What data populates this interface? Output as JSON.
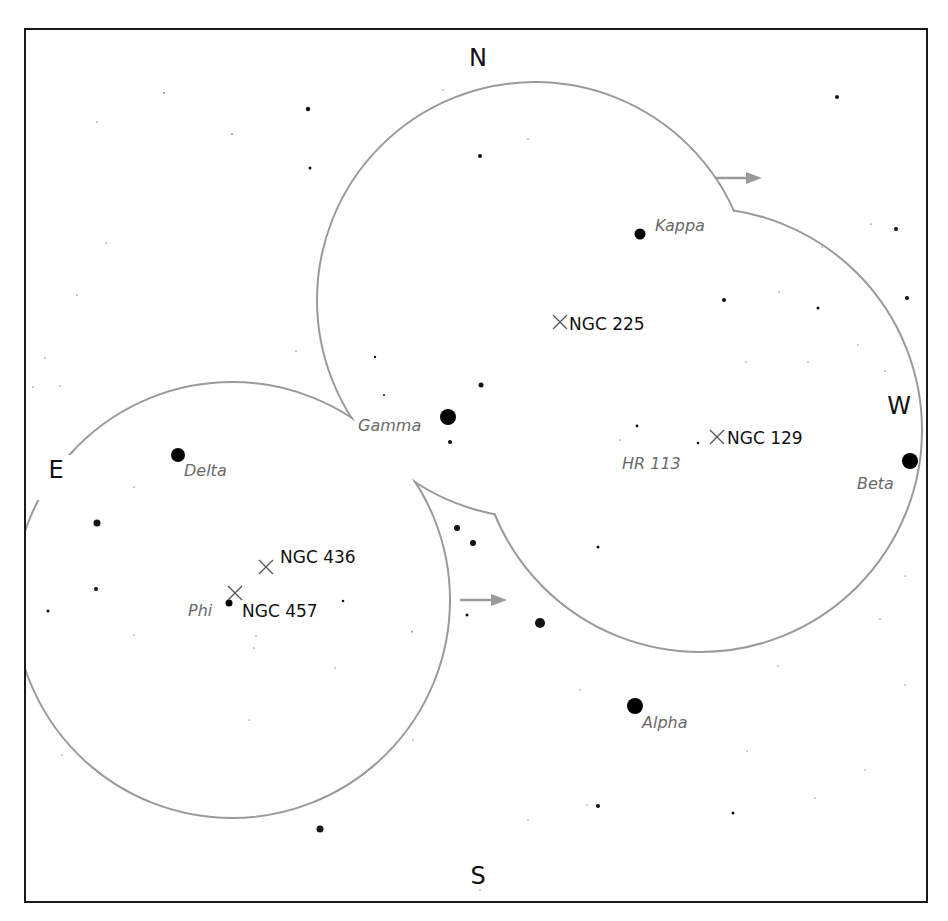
{
  "map": {
    "type": "sky-finder-chart",
    "compass": {
      "north": "N",
      "south": "S",
      "east": "E",
      "west": "W"
    },
    "colors": {
      "outline": "#9a9a9a",
      "star": "#000000",
      "star_label": "#6a6a6a",
      "object_label": "#111111",
      "frame": "#1a1a1a"
    },
    "named_stars": [
      {
        "name": "Kappa",
        "x": 640,
        "y": 234,
        "r": 5.5
      },
      {
        "name": "Gamma",
        "x": 448,
        "y": 417,
        "r": 8
      },
      {
        "name": "Delta",
        "x": 178,
        "y": 455,
        "r": 7
      },
      {
        "name": "Beta",
        "x": 910,
        "y": 461,
        "r": 8
      },
      {
        "name": "Alpha",
        "x": 635,
        "y": 706,
        "r": 8
      },
      {
        "name": "Phi",
        "x": 229,
        "y": 603,
        "r": 3.5
      },
      {
        "name": "HR 113",
        "x": 698,
        "y": 443,
        "r": 1.2
      }
    ],
    "deep_sky_objects": [
      {
        "name": "NGC 225",
        "x": 560,
        "y": 322
      },
      {
        "name": "NGC 129",
        "x": 717,
        "y": 437
      },
      {
        "name": "NGC 436",
        "x": 266,
        "y": 567
      },
      {
        "name": "NGC 457",
        "x": 235,
        "y": 593
      }
    ],
    "motion_arrows": [
      {
        "x1": 716,
        "y1": 178,
        "x2": 762,
        "y2": 178
      },
      {
        "x1": 460,
        "y1": 600,
        "x2": 507,
        "y2": 600
      }
    ],
    "field_circles": [
      {
        "cx": 535,
        "cy": 300,
        "r": 218
      },
      {
        "cx": 700,
        "cy": 430,
        "r": 222
      },
      {
        "cx": 232,
        "cy": 600,
        "r": 218
      }
    ]
  }
}
